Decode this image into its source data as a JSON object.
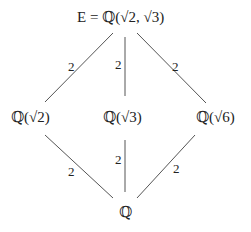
{
  "nodes": {
    "top": "E = ℚ(√2, √3)",
    "left": "ℚ(√2)",
    "middle": "ℚ(√3)",
    "right": "ℚ(√6)",
    "bottom": "ℚ"
  },
  "edges": {
    "top_left": "2",
    "top_middle": "2",
    "top_right": "2",
    "left_bottom": "2",
    "middle_bottom": "2",
    "right_bottom": "2"
  }
}
